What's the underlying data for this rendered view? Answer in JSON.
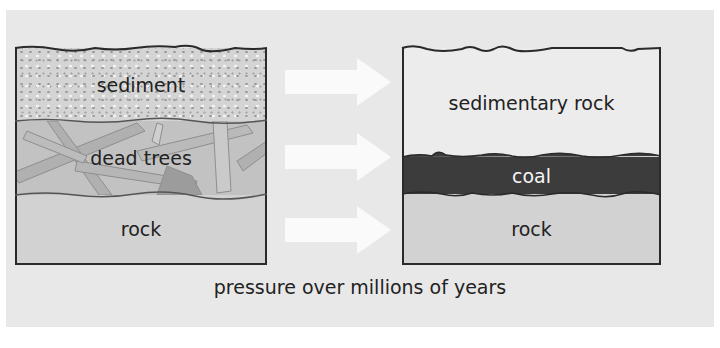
{
  "diagram": {
    "type": "process",
    "title": "",
    "caption": "pressure over millions of years",
    "before": {
      "layers": [
        {
          "id": "sediment",
          "label": "sediment",
          "color": "#d4d4d4",
          "texture": "speckled"
        },
        {
          "id": "dead-trees",
          "label": "dead trees",
          "color": "#c2c2c2",
          "texture": "branches"
        },
        {
          "id": "rock",
          "label": "rock",
          "color": "#d2d2d2"
        }
      ]
    },
    "after": {
      "layers": [
        {
          "id": "sedimentary-rock",
          "label": "sedimentary rock",
          "color": "#ececec"
        },
        {
          "id": "coal",
          "label": "coal",
          "color": "#3c3c3c"
        },
        {
          "id": "rock",
          "label": "rock",
          "color": "#d2d2d2"
        }
      ]
    },
    "arrows": [
      {
        "from": "sediment",
        "to": "sedimentary-rock",
        "color": "#fafafa"
      },
      {
        "from": "dead-trees",
        "to": "coal",
        "color": "#fafafa"
      },
      {
        "from": "rock",
        "to": "rock",
        "color": "#fafafa"
      }
    ],
    "colors": {
      "panel_background": "#e8e8e8",
      "border": "#2a2a2a",
      "text": "#222222"
    }
  }
}
